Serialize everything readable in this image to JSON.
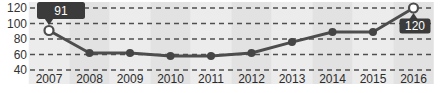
{
  "chart_data": {
    "type": "line",
    "title": "",
    "xlabel": "",
    "ylabel": "",
    "x": [
      2007,
      2008,
      2009,
      2010,
      2011,
      2012,
      2013,
      2014,
      2015,
      2016
    ],
    "xticklabels": [
      "2007",
      "2008",
      "2009",
      "2010",
      "2011",
      "2012",
      "2013",
      "2014",
      "2015",
      "2016"
    ],
    "series": [
      {
        "name": "value",
        "values": [
          91,
          62,
          62,
          58,
          58,
          62,
          76,
          89,
          89,
          120
        ]
      }
    ],
    "ylim": [
      40,
      120
    ],
    "yticks": [
      40,
      60,
      80,
      100,
      120
    ],
    "yticklabels": [
      "40",
      "60",
      "80",
      "100",
      "120"
    ],
    "grid": "horizontal-dashed",
    "legend": "none",
    "background": "alternating-vertical-year-bands",
    "annotations": [
      {
        "x": 2007,
        "label": "91",
        "pos": "above"
      },
      {
        "x": 2016,
        "label": "120",
        "pos": "below"
      }
    ],
    "colors": {
      "line": "#4d4d4d",
      "marker_fill": "#454545",
      "endpoint_fill": "#ffffff",
      "endpoint_stroke": "#4d4d4d",
      "callout_bg": "#3b3b3b",
      "callout_text": "#ffffff",
      "band_light": "#ececec",
      "band_dark": "#e2e2e2",
      "grid": "#4f4f4f",
      "y_axis_text": "#333333",
      "x_axis_text": "#2b2b2b"
    }
  }
}
